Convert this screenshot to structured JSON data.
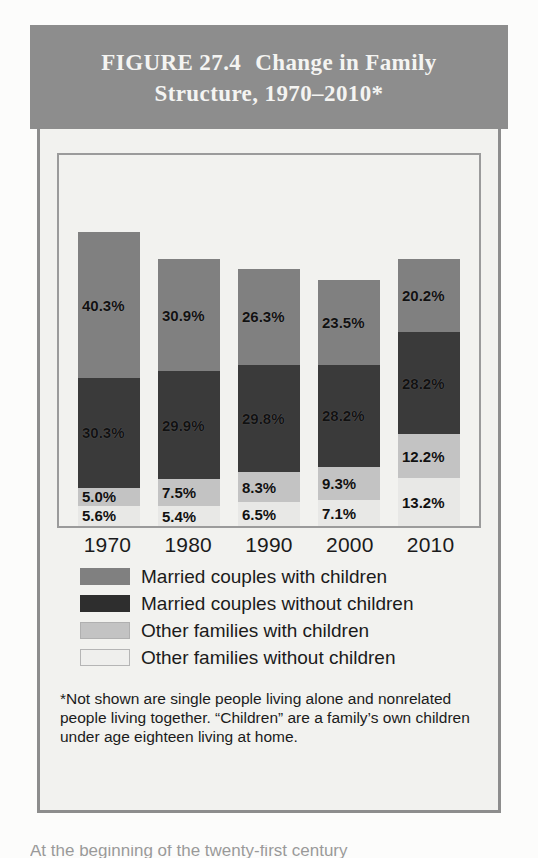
{
  "figure": {
    "title_line1": "FIGURE 27.4",
    "title_line2": "Change in Family",
    "title_line3": "Structure, 1970–2010*"
  },
  "chart_data": {
    "type": "bar",
    "subtype": "stacked-bar",
    "xlabel": "",
    "ylabel": "",
    "ylim": [
      0,
      100
    ],
    "grid": false,
    "legend_position": "below",
    "stack_order_top_to_bottom": [
      "Married couples with children",
      "Married couples without children",
      "Other families with children",
      "Other families without children"
    ],
    "categories": [
      "1970",
      "1980",
      "1990",
      "2000",
      "2010"
    ],
    "series": [
      {
        "name": "Married couples with children",
        "color": "#808080",
        "values": [
          40.3,
          30.9,
          26.3,
          23.5,
          20.2
        ],
        "labels": [
          "40.3%",
          "30.9%",
          "26.3%",
          "23.5%",
          "20.2%"
        ]
      },
      {
        "name": "Married couples without children",
        "color": "#3a3a3a",
        "values": [
          30.3,
          29.9,
          29.8,
          28.2,
          28.2
        ],
        "labels": [
          "30.3%",
          "29.9%",
          "29.8%",
          "28.2%",
          "28.2%"
        ]
      },
      {
        "name": "Other families with children",
        "color": "#c3c3c3",
        "values": [
          5.0,
          7.5,
          8.3,
          9.3,
          12.2
        ],
        "labels": [
          "5.0%",
          "7.5%",
          "8.3%",
          "9.3%",
          "12.2%"
        ]
      },
      {
        "name": "Other families without children",
        "color": "#e8e8e6",
        "values": [
          5.6,
          5.4,
          6.5,
          7.1,
          13.2
        ],
        "labels": [
          "5.6%",
          "5.4%",
          "6.5%",
          "7.1%",
          "13.2%"
        ]
      }
    ]
  },
  "legend": {
    "items": [
      {
        "label": "Married couples with children"
      },
      {
        "label": "Married couples without children"
      },
      {
        "label": "Other families with children"
      },
      {
        "label": "Other families without children"
      }
    ]
  },
  "footnote": {
    "text": "*Not shown are single people living alone and nonrelated people living together. “Children” are a family’s own children under age eighteen living at home."
  },
  "page": {
    "cut_off_line": "At the beginning of the twenty-first century"
  },
  "colors": {
    "header_band": "#8d8d8d",
    "panel": "#f2f2ef",
    "married_with_children": "#808080",
    "married_without_children": "#3a3a3a",
    "other_with_children": "#c3c3c3",
    "other_without_children": "#e8e8e6"
  }
}
